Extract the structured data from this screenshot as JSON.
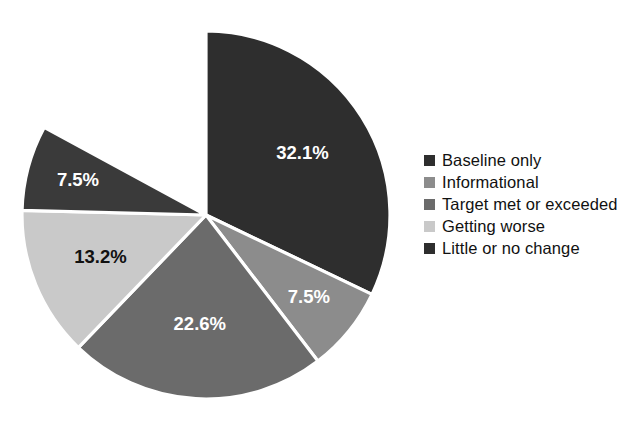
{
  "chart_data": {
    "type": "pie",
    "title": "Public Health Infrastructure",
    "subtitle": "",
    "xlabel": "",
    "ylabel": "",
    "legend_position": "right",
    "grid": false,
    "start_angle_deg": 0,
    "direction": "clockwise",
    "categories": [
      "Baseline only",
      "Informational",
      "Target met or exceeded",
      "Getting worse",
      "Little or no change"
    ],
    "values": [
      32.1,
      7.5,
      22.6,
      13.2,
      7.5
    ],
    "value_labels": [
      "32.1%",
      "7.5%",
      "22.6%",
      "13.2%",
      "7.5%"
    ],
    "colors": [
      "#2e2e2e",
      "#8c8c8c",
      "#6b6b6b",
      "#c9c9c9",
      "#3a3a3a"
    ],
    "label_text_colors": [
      "#ffffff",
      "#ffffff",
      "#ffffff",
      "#111111",
      "#ffffff"
    ],
    "slice_separator_color": "#ffffff",
    "background_color": "#ffffff",
    "slices": [
      {
        "name": "Baseline only",
        "value": 32.1,
        "label": "32.1%",
        "color": "#2e2e2e",
        "label_color": "#ffffff",
        "start_deg": 0.0,
        "end_deg": 115.56,
        "label_r_frac": 0.62
      },
      {
        "name": "Informational",
        "value": 7.5,
        "label": "7.5%",
        "color": "#8c8c8c",
        "label_color": "#ffffff",
        "start_deg": 115.56,
        "end_deg": 142.56,
        "label_r_frac": 0.72
      },
      {
        "name": "Target met or exceeded",
        "value": 22.6,
        "label": "22.6%",
        "color": "#6b6b6b",
        "label_color": "#ffffff",
        "start_deg": 142.56,
        "end_deg": 223.92,
        "label_r_frac": 0.6
      },
      {
        "name": "Getting worse",
        "value": 13.2,
        "label": "13.2%",
        "color": "#c9c9c9",
        "label_color": "#111111",
        "start_deg": 223.92,
        "end_deg": 271.44,
        "label_r_frac": 0.62
      },
      {
        "name": "Little or no change",
        "value": 7.5,
        "label": "7.5%",
        "color": "#3a3a3a",
        "label_color": "#ffffff",
        "start_deg": 271.44,
        "end_deg": 298.44,
        "label_r_frac": 0.72
      }
    ]
  },
  "legend": {
    "items": [
      {
        "label": "Baseline only",
        "color": "#2e2e2e"
      },
      {
        "label": "Informational",
        "color": "#8c8c8c"
      },
      {
        "label": "Target met or exceeded",
        "color": "#6b6b6b"
      },
      {
        "label": "Getting worse",
        "color": "#c9c9c9"
      },
      {
        "label": "Little or no change",
        "color": "#2e2e2e"
      }
    ]
  }
}
